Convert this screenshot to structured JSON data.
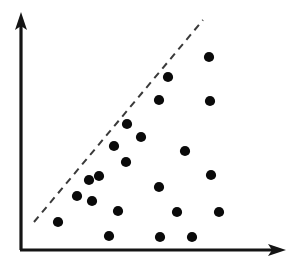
{
  "figure": {
    "title": "",
    "background_color": "#ffffff",
    "width": 297,
    "height": 272
  },
  "axes": {
    "color": "#141414",
    "origin_x": 21,
    "origin_y": 250,
    "y_axis_top": 13,
    "x_axis_right": 286,
    "x_label": "",
    "y_label": "",
    "arrowheads": "both",
    "tick_labels_visible": false
  },
  "annotations": {
    "boundary": {
      "name": "dashed-decision-boundary",
      "style": "dashed",
      "color": "#3a3a3a",
      "x1": 34,
      "y1": 222,
      "x2": 203,
      "y2": 20
    }
  },
  "chart_data": {
    "type": "scatter",
    "title": "",
    "xlabel": "",
    "ylabel": "",
    "xlim": [
      21,
      286
    ],
    "ylim": [
      13,
      250
    ],
    "grid": false,
    "legend": null,
    "marker_color": "#0a0a0a",
    "marker_radius": 5.1,
    "point_count": 22,
    "points": [
      {
        "x": 209,
        "y": 57
      },
      {
        "x": 168,
        "y": 77
      },
      {
        "x": 159,
        "y": 100
      },
      {
        "x": 210,
        "y": 101
      },
      {
        "x": 127,
        "y": 124
      },
      {
        "x": 141,
        "y": 137
      },
      {
        "x": 114,
        "y": 146
      },
      {
        "x": 185,
        "y": 151
      },
      {
        "x": 126,
        "y": 162
      },
      {
        "x": 211,
        "y": 175
      },
      {
        "x": 99,
        "y": 176
      },
      {
        "x": 89,
        "y": 180
      },
      {
        "x": 159,
        "y": 187
      },
      {
        "x": 77,
        "y": 196
      },
      {
        "x": 92,
        "y": 201
      },
      {
        "x": 118,
        "y": 211
      },
      {
        "x": 177,
        "y": 212
      },
      {
        "x": 219,
        "y": 212
      },
      {
        "x": 58,
        "y": 222
      },
      {
        "x": 109,
        "y": 236
      },
      {
        "x": 160,
        "y": 237
      },
      {
        "x": 192,
        "y": 237
      }
    ],
    "annotation_line": {
      "type": "dashed-line",
      "from": [
        34,
        222
      ],
      "to": [
        203,
        20
      ]
    }
  }
}
